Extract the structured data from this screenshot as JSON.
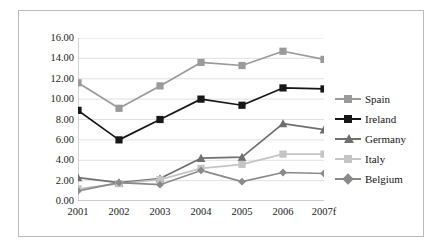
{
  "chart_data": {
    "type": "line",
    "title": "",
    "subtitle": "",
    "xlabel": "",
    "ylabel": "",
    "categories": [
      "2001",
      "2002",
      "2003",
      "2004",
      "2005",
      "2006",
      "2007f"
    ],
    "ylim": [
      0,
      16
    ],
    "ytick_step": 2,
    "ytick_labels": [
      "0.00",
      "2.00",
      "4.00",
      "6.00",
      "8.00",
      "10.00",
      "12.00",
      "14.00",
      "16.00"
    ],
    "ytick_values": [
      0,
      2,
      4,
      6,
      8,
      10,
      12,
      14,
      16
    ],
    "grid": true,
    "grid_axis": "y",
    "legend_position": "right",
    "series": [
      {
        "name": "Spain",
        "color": "#9a9a9a",
        "marker": "square",
        "values": [
          11.6,
          9.1,
          11.3,
          13.6,
          13.3,
          14.7,
          13.9
        ]
      },
      {
        "name": "Ireland",
        "color": "#171717",
        "marker": "square",
        "values": [
          8.9,
          6.0,
          8.0,
          10.0,
          9.4,
          11.1,
          11.0
        ]
      },
      {
        "name": "Germany",
        "color": "#6f6f6f",
        "marker": "triangle",
        "values": [
          2.3,
          1.8,
          2.2,
          4.2,
          4.3,
          7.6,
          7.0
        ]
      },
      {
        "name": "Italy",
        "color": "#c4c4c4",
        "marker": "square",
        "values": [
          1.2,
          1.7,
          2.1,
          3.2,
          3.6,
          4.6,
          4.6
        ]
      },
      {
        "name": "Belgium",
        "color": "#8a8a8a",
        "marker": "diamond",
        "values": [
          1.0,
          1.8,
          1.6,
          3.0,
          1.9,
          2.8,
          2.7
        ]
      }
    ]
  },
  "legend": {
    "items": [
      {
        "label": "Spain"
      },
      {
        "label": "Ireland"
      },
      {
        "label": "Germany"
      },
      {
        "label": "Italy"
      },
      {
        "label": "Belgium"
      }
    ]
  }
}
